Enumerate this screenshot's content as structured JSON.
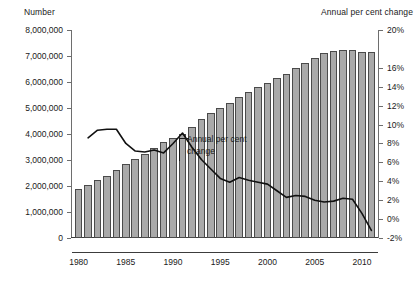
{
  "chart_data": {
    "type": "bar",
    "title": "",
    "xlabel": "",
    "ylabel": "Number",
    "y2label": "Annual per cent change",
    "grid": false,
    "legend_position": "inline-annotation",
    "x": [
      1980,
      1981,
      1982,
      1983,
      1984,
      1985,
      1986,
      1987,
      1988,
      1989,
      1990,
      1991,
      1992,
      1993,
      1994,
      1995,
      1996,
      1997,
      1998,
      1999,
      2000,
      2001,
      2002,
      2003,
      2004,
      2005,
      2006,
      2007,
      2008,
      2009,
      2010,
      2011
    ],
    "xlim": [
      1979.3,
      2011.7
    ],
    "xticks": [
      1980,
      1985,
      1990,
      1995,
      2000,
      2005,
      2010
    ],
    "xtick_labels": [
      "1980",
      "1985",
      "1990",
      "1995",
      "2000",
      "2005",
      "2010"
    ],
    "ylim": [
      0,
      8000000
    ],
    "yticks": [
      0,
      1000000,
      2000000,
      3000000,
      4000000,
      5000000,
      6000000,
      7000000,
      8000000
    ],
    "ytick_labels": [
      "0",
      "1,000,000",
      "2,000,000",
      "3,000,000",
      "4,000,000",
      "5,000,000",
      "6,000,000",
      "7,000,000",
      "8,000,000"
    ],
    "y2lim": [
      -2,
      20
    ],
    "y2ticks": [
      -2,
      0,
      2,
      4,
      6,
      8,
      10,
      12,
      14,
      16,
      20
    ],
    "y2tick_labels": [
      "-2%",
      "0%",
      "2%",
      "4%",
      "6%",
      "8%",
      "10%",
      "12%",
      "14%",
      "16%",
      "20%"
    ],
    "series": [
      {
        "name": "Number",
        "type": "bar",
        "axis": "left",
        "color": "#a9a9a9",
        "edge_color": "#4a4a4a",
        "values": [
          1880000,
          2050000,
          2220000,
          2400000,
          2620000,
          2840000,
          3020000,
          3230000,
          3450000,
          3700000,
          3860000,
          4010000,
          4280000,
          4560000,
          4800000,
          5000000,
          5200000,
          5420000,
          5630000,
          5800000,
          5960000,
          6140000,
          6320000,
          6530000,
          6720000,
          6940000,
          7120000,
          7200000,
          7230000,
          7220000,
          7160000,
          7140000
        ]
      },
      {
        "name": "Annual per cent change",
        "type": "line",
        "axis": "right",
        "color": "#111111",
        "values": [
          null,
          8.6,
          9.4,
          9.5,
          9.5,
          8.0,
          7.2,
          7.1,
          7.3,
          7.0,
          8.0,
          9.1,
          7.6,
          6.3,
          5.3,
          4.3,
          3.9,
          4.4,
          4.1,
          3.9,
          3.7,
          3.0,
          2.3,
          2.5,
          2.4,
          2.0,
          1.8,
          1.9,
          2.2,
          2.1,
          0.6,
          -1.2
        ]
      }
    ],
    "annotations": [
      {
        "text_line1": "Annual per cent",
        "text_line2": "change",
        "target_series": "Annual per cent change"
      }
    ]
  },
  "axis_titles": {
    "left": "Number",
    "right": "Annual per cent change"
  }
}
